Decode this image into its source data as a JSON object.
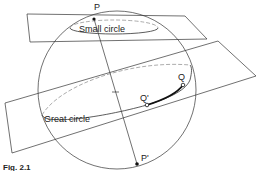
{
  "figure": {
    "labels": {
      "p": "P",
      "p_prime": "P'",
      "q": "Q",
      "q_prime": "Q'",
      "small_circle": "Small circle",
      "great_circle": "Great circle"
    },
    "caption": "Fig. 2.1"
  },
  "colors": {
    "line": "#333333",
    "dashed": "#888888",
    "background": "#ffffff"
  }
}
